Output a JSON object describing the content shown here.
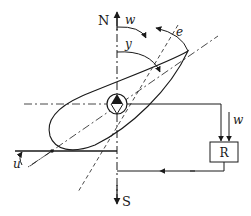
{
  "diagram": {
    "labels": {
      "north": "N",
      "south": "S",
      "w_angle": "w",
      "y_angle": "y",
      "e_angle": "e",
      "u_angle": "u",
      "w_input": "w",
      "regulator": "R"
    },
    "colors": {
      "stroke": "#1a1a1a",
      "background": "#ffffff"
    }
  }
}
